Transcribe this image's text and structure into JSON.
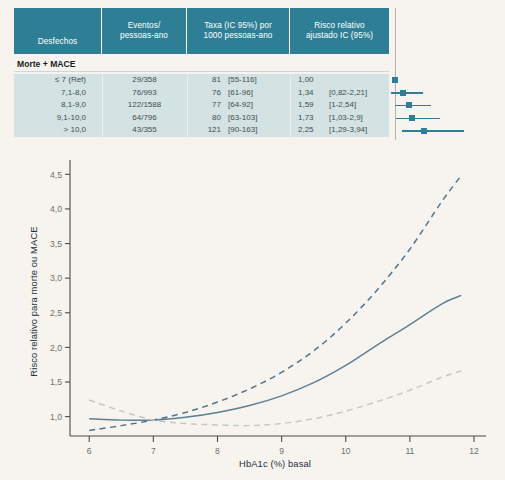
{
  "figure": {
    "background_color": "#f7f4ef",
    "accent_color": "#2e7f96",
    "row_band_color": "#d3e2e3"
  },
  "table": {
    "headers": [
      "Desfechos",
      "Eventos/\npessoas-ano",
      "Taxa (IC 95%) por\n1000 pessoas-ano",
      "Risco relativo\najustado IC (95%)"
    ],
    "header_lines": [
      [
        "Desfechos"
      ],
      [
        "Eventos/",
        "pessoas-ano"
      ],
      [
        "Taxa (IC 95%) por",
        "1000 pessoas-ano"
      ],
      [
        "Risco relativo",
        "ajustado IC (95%)"
      ]
    ],
    "section_label": "Morte + MACE",
    "rows": [
      {
        "desfecho": "≤ 7 (Ref)",
        "eventos": "29/358",
        "taxa": "81",
        "taxa_ic": "[55-116]",
        "rr": "1,00",
        "rr_ic": "",
        "rr_value": 1.0,
        "rr_low": 1.0,
        "rr_high": 1.0
      },
      {
        "desfecho": "7,1-8,0",
        "eventos": "76/993",
        "taxa": "76",
        "taxa_ic": "[61-96]",
        "rr": "1,34",
        "rr_ic": "[0,82-2,21]",
        "rr_value": 1.34,
        "rr_low": 0.82,
        "rr_high": 2.21
      },
      {
        "desfecho": "8,1-9,0",
        "eventos": "122/1588",
        "taxa": "77",
        "taxa_ic": "[64-92]",
        "rr": "1,59",
        "rr_ic": "[1-2,54]",
        "rr_value": 1.59,
        "rr_low": 1.0,
        "rr_high": 2.54
      },
      {
        "desfecho": "9,1-10,0",
        "eventos": "64/796",
        "taxa": "80",
        "taxa_ic": "[63-103]",
        "rr": "1,73",
        "rr_ic": "[1,03-2,9]",
        "rr_value": 1.73,
        "rr_low": 1.03,
        "rr_high": 2.9
      },
      {
        "desfecho": "> 10,0",
        "eventos": "43/355",
        "taxa": "121",
        "taxa_ic": "[90-163]",
        "rr": "2,25",
        "rr_ic": "[1,29-3,94]",
        "rr_value": 2.25,
        "rr_low": 1.29,
        "rr_high": 3.94
      }
    ]
  },
  "forest_plot": {
    "reference_line_value": 1.0,
    "marker_color": "#2e7f96",
    "axis_color": "#b9b2a8"
  },
  "chart_data": {
    "type": "line",
    "title": "",
    "xlabel": "HbA1c (%) basal",
    "ylabel": "Risco relativo para morte ou MACE",
    "xlim": [
      5.7,
      12.0
    ],
    "ylim": [
      0.72,
      4.62
    ],
    "xticks": [
      6,
      7,
      8,
      9,
      10,
      11,
      12
    ],
    "xtick_labels": [
      "6",
      "7",
      "8",
      "9",
      "10",
      "11",
      "12"
    ],
    "yticks": [
      1.0,
      1.5,
      2.0,
      2.5,
      3.0,
      3.5,
      4.0,
      4.5
    ],
    "ytick_labels": [
      "1,0",
      "1,5",
      "2,0",
      "2,5",
      "3,0",
      "3,5",
      "4,0",
      "4,5"
    ],
    "grid": false,
    "legend": "none",
    "x": [
      6.0,
      6.5,
      7.0,
      7.5,
      8.0,
      8.5,
      9.0,
      9.5,
      10.0,
      10.5,
      11.0,
      11.5,
      11.8
    ],
    "series": [
      {
        "name": "Risco relativo (estimativa pontual)",
        "style": "solid",
        "color": "#5b7f93",
        "values": [
          0.97,
          0.95,
          0.95,
          0.99,
          1.06,
          1.16,
          1.3,
          1.49,
          1.74,
          2.04,
          2.33,
          2.63,
          2.75
        ]
      },
      {
        "name": "Limite superior IC 95%",
        "style": "dashed",
        "color": "#54748c",
        "values": [
          0.8,
          0.87,
          0.95,
          1.06,
          1.21,
          1.4,
          1.64,
          1.95,
          2.35,
          2.84,
          3.42,
          4.11,
          4.48
        ]
      },
      {
        "name": "Limite inferior IC 95%",
        "style": "dashed",
        "color": "#c2c9c4",
        "values": [
          1.24,
          1.08,
          0.95,
          0.9,
          0.88,
          0.87,
          0.9,
          0.97,
          1.08,
          1.22,
          1.38,
          1.57,
          1.66
        ]
      }
    ]
  }
}
